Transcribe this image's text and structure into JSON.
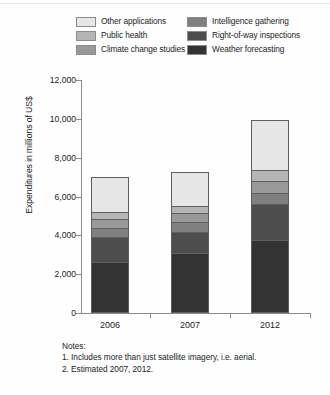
{
  "chart_data": {
    "type": "bar",
    "subtype": "stacked-vertical",
    "title": "",
    "xlabel": "",
    "ylabel": "Expenditures in millions of US$",
    "categories": [
      "2006",
      "2007",
      "2012"
    ],
    "ylim": [
      0,
      12000
    ],
    "yticks": [
      0,
      2000,
      4000,
      6000,
      8000,
      10000,
      12000
    ],
    "ytick_labels": [
      "0",
      "2,000",
      "4,000",
      "6,000",
      "8,000",
      "10,000",
      "12,000"
    ],
    "grid": false,
    "legend_position": "top",
    "stack_order_bottom_to_top": [
      "Weather forecasting",
      "Right-of-way inspections",
      "Intelligence gathering",
      "Climate change studies",
      "Public health",
      "Other applications"
    ],
    "series": [
      {
        "name": "Weather forecasting",
        "color": "#333333",
        "values": [
          2600,
          3100,
          3750
        ]
      },
      {
        "name": "Right-of-way inspections",
        "color": "#4d4d4d",
        "values": [
          1300,
          1100,
          1850
        ]
      },
      {
        "name": "Intelligence gathering",
        "color": "#808080",
        "values": [
          500,
          500,
          600
        ]
      },
      {
        "name": "Climate change studies",
        "color": "#999999",
        "values": [
          450,
          450,
          600
        ]
      },
      {
        "name": "Public health",
        "color": "#b5b5b5",
        "values": [
          400,
          400,
          600
        ]
      },
      {
        "name": "Other applications",
        "color": "#e6e6e6",
        "values": [
          1750,
          1700,
          2550
        ]
      }
    ],
    "totals": [
      7000,
      7250,
      9950
    ]
  },
  "legend": {
    "column_left": [
      {
        "label": "Other applications",
        "color": "#e6e6e6"
      },
      {
        "label": "Public health",
        "color": "#b5b5b5"
      },
      {
        "label": "Climate change studies",
        "color": "#999999"
      }
    ],
    "column_right": [
      {
        "label": "Intelligence gathering",
        "color": "#808080"
      },
      {
        "label": "Right-of-way inspections",
        "color": "#4d4d4d"
      },
      {
        "label": "Weather forecasting",
        "color": "#333333"
      }
    ]
  },
  "notes": {
    "heading": "Notes:",
    "items": [
      "1. Includes more than just satellite imagery, i.e. aerial.",
      "2. Estimated 2007, 2012."
    ]
  }
}
